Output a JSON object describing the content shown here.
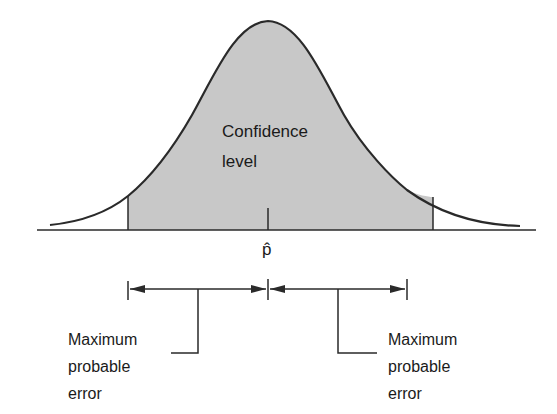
{
  "diagram": {
    "type": "normal-distribution-confidence-interval",
    "center_label": "p̂",
    "shaded_region_label_line1": "Confidence",
    "shaded_region_label_line2": "level",
    "left_annotation": {
      "line1": "Maximum",
      "line2": "probable",
      "line3": "error"
    },
    "right_annotation": {
      "line1": "Maximum",
      "line2": "probable",
      "line3": "error"
    },
    "colors": {
      "shade": "#c8c8c8",
      "stroke": "#2a2a2a",
      "background": "#ffffff"
    }
  }
}
